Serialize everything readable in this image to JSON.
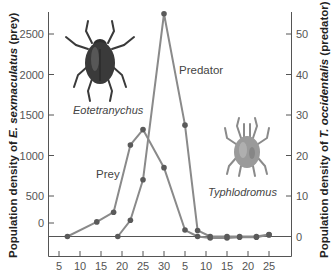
{
  "chart_data": {
    "type": "line",
    "title": "",
    "xlabel": "",
    "ylabel_left": "Population density of E. sexmaculatus (prey)",
    "ylabel_right": "Population density of T. occidentalis (predator)",
    "ylabel_left_parts": {
      "pre": "Population density of ",
      "species": "E. sexmaculatus",
      "post": " (prey)"
    },
    "ylabel_right_parts": {
      "pre": "Population density of ",
      "species": "T. occidentalis",
      "post": " (predator)"
    },
    "x_tick_labels": [
      "5",
      "10",
      "15",
      "20",
      "25",
      "30",
      "5",
      "10",
      "15",
      "20",
      "25"
    ],
    "y_left_ticks": [
      "2500",
      "2000",
      "1500",
      "1000",
      "500",
      "0"
    ],
    "y_right_ticks": [
      "50",
      "40",
      "30",
      "20",
      "10",
      "0"
    ],
    "ylim_left": [
      0,
      2750
    ],
    "ylim_right": [
      0,
      55
    ],
    "grid": false,
    "legend": "inline labels",
    "series": [
      {
        "name": "Prey",
        "axis": "left",
        "x": [
          7,
          14,
          18,
          22,
          25,
          30,
          35,
          38,
          41,
          45,
          48,
          52,
          55
        ],
        "values": [
          0,
          180,
          300,
          1130,
          1320,
          850,
          80,
          0,
          -20,
          -20,
          -10,
          -10,
          20
        ]
      },
      {
        "name": "Predator",
        "axis": "right",
        "x": [
          19,
          22,
          25,
          30,
          35,
          38,
          41,
          45,
          48,
          52,
          55
        ],
        "values": [
          0,
          4,
          14,
          55,
          27.5,
          1.5,
          0,
          0,
          0,
          0,
          0.5
        ]
      }
    ],
    "annotations": [
      {
        "text": "Prey",
        "type": "series-label"
      },
      {
        "text": "Predator",
        "type": "series-label"
      },
      {
        "text": "Eotetranychus",
        "type": "illustration-caption"
      },
      {
        "text": "Typhlodromus",
        "type": "illustration-caption"
      }
    ]
  },
  "labels": {
    "prey": "Prey",
    "predator": "Predator",
    "prey_species": "Eotetranychus",
    "predator_species": "Typhlodromus"
  },
  "colors": {
    "line": "#8a8a8a",
    "marker": "#5a5a5a",
    "axis": "#555555",
    "mite_prey": "#3a3a3a",
    "mite_predator": "#8a8a8a"
  }
}
